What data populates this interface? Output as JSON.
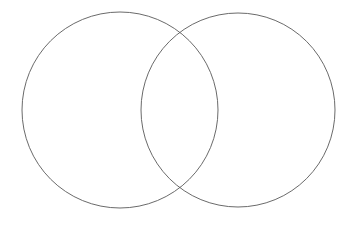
{
  "document": {
    "kind": "venn-diagram",
    "title": "",
    "width": 356,
    "height": 227,
    "background_color": "#ffffff"
  },
  "style": {
    "stroke_color": "#595959",
    "stroke_width": 0.9,
    "fill": "none",
    "fill_color": "#ffffff"
  },
  "diagram": {
    "set_count": 2,
    "labels": {
      "left_set": "",
      "right_set": "",
      "intersection": "",
      "outside": ""
    },
    "circles": [
      {
        "name": "left-set-circle",
        "cx": 120,
        "cy": 110,
        "r": 98,
        "stroke": "#595959",
        "stroke_width": 0.9,
        "fill": "none"
      },
      {
        "name": "right-set-circle",
        "cx": 238,
        "cy": 110,
        "r": 97,
        "stroke": "#595959",
        "stroke_width": 0.9,
        "fill": "none"
      }
    ],
    "intersection_points": [
      {
        "name": "upper-crossing",
        "x": 180,
        "y": 32
      },
      {
        "name": "lower-crossing",
        "x": 180,
        "y": 188
      }
    ]
  }
}
